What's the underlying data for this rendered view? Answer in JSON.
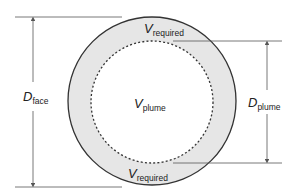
{
  "diagram": {
    "colors": {
      "annulus_fill": "#e6e6e6",
      "outline": "#333333",
      "dashed": "#333333",
      "dimension_lines": "#555555"
    },
    "labels": {
      "v_required_top": {
        "symbol": "V",
        "subscript": "required"
      },
      "v_required_bottom": {
        "symbol": "V",
        "subscript": "required"
      },
      "v_plume": {
        "symbol": "V",
        "subscript": "plume"
      },
      "d_face": {
        "symbol": "D",
        "subscript": "face"
      },
      "d_plume": {
        "symbol": "D",
        "subscript": "plume"
      }
    }
  }
}
